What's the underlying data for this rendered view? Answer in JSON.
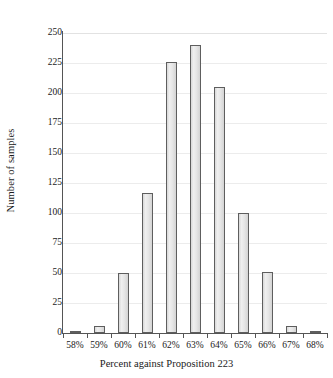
{
  "chart_data": {
    "type": "bar",
    "title": "",
    "xlabel": "Percent against Proposition 223",
    "ylabel": "Number of samples",
    "categories": [
      "58%",
      "59%",
      "60%",
      "61%",
      "62%",
      "63%",
      "64%",
      "65%",
      "66%",
      "67%",
      "68%"
    ],
    "values": [
      2,
      6,
      50,
      117,
      226,
      240,
      205,
      100,
      51,
      6,
      1
    ],
    "ylim": [
      0,
      250
    ],
    "yticks": [
      0,
      25,
      50,
      75,
      100,
      125,
      150,
      175,
      200,
      225,
      250
    ],
    "ytick_labels": [
      "0",
      "25",
      "50",
      "75",
      "100",
      "125",
      "150",
      "175",
      "200",
      "225",
      "250"
    ],
    "grid": true,
    "grid_axis": "y",
    "legend": false,
    "bar_fill_color": "#e9e9e9",
    "bar_edge_color": "#5e5e5e",
    "axis_color": "#555555",
    "gridline_color": "#ececec",
    "background_color": "#ffffff"
  }
}
